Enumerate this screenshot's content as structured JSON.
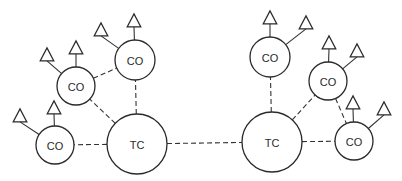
{
  "diagram": {
    "type": "network-topology",
    "width": 402,
    "height": 181,
    "colors": {
      "stroke": "#2a2a2a",
      "fill": "#ffffff",
      "background": "#ffffff"
    },
    "nodes": [
      {
        "id": "tc_left",
        "label": "TC",
        "x": 137,
        "y": 144,
        "r": 30
      },
      {
        "id": "tc_right",
        "label": "TC",
        "x": 272,
        "y": 142,
        "r": 30
      },
      {
        "id": "co_l1",
        "label": "CO",
        "x": 55,
        "y": 145,
        "r": 19
      },
      {
        "id": "co_l2",
        "label": "CO",
        "x": 76,
        "y": 86,
        "r": 19
      },
      {
        "id": "co_l3",
        "label": "CO",
        "x": 135,
        "y": 60,
        "r": 20
      },
      {
        "id": "co_r1",
        "label": "CO",
        "x": 270,
        "y": 57,
        "r": 20
      },
      {
        "id": "co_r2",
        "label": "CO",
        "x": 328,
        "y": 81,
        "r": 19
      },
      {
        "id": "co_r3",
        "label": "CO",
        "x": 354,
        "y": 141,
        "r": 19
      }
    ],
    "trunk_links": [
      [
        "tc_left",
        "tc_right"
      ],
      [
        "tc_left",
        "co_l1"
      ],
      [
        "tc_left",
        "co_l2"
      ],
      [
        "tc_left",
        "co_l3"
      ],
      [
        "co_l2",
        "co_l3"
      ],
      [
        "tc_right",
        "co_r1"
      ],
      [
        "tc_right",
        "co_r2"
      ],
      [
        "tc_right",
        "co_r3"
      ],
      [
        "co_r2",
        "co_r3"
      ]
    ],
    "terminals": [
      {
        "parent": "co_l1",
        "x": 20,
        "y": 116
      },
      {
        "parent": "co_l1",
        "x": 54,
        "y": 108
      },
      {
        "parent": "co_l2",
        "x": 47,
        "y": 55
      },
      {
        "parent": "co_l2",
        "x": 76,
        "y": 48
      },
      {
        "parent": "co_l3",
        "x": 101,
        "y": 30
      },
      {
        "parent": "co_l3",
        "x": 134,
        "y": 21
      },
      {
        "parent": "co_r1",
        "x": 270,
        "y": 18
      },
      {
        "parent": "co_r1",
        "x": 306,
        "y": 23
      },
      {
        "parent": "co_r2",
        "x": 329,
        "y": 43
      },
      {
        "parent": "co_r2",
        "x": 357,
        "y": 51
      },
      {
        "parent": "co_r3",
        "x": 353,
        "y": 103
      },
      {
        "parent": "co_r3",
        "x": 384,
        "y": 109
      }
    ]
  }
}
